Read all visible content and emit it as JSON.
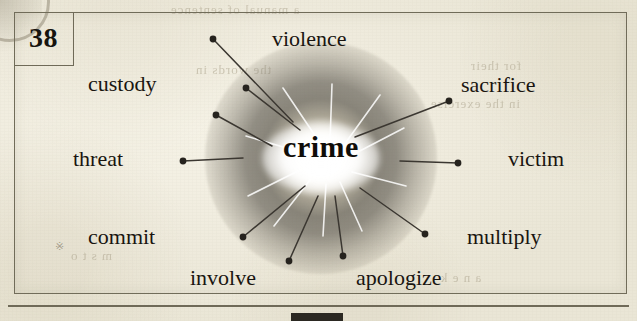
{
  "exercise": {
    "number": "38",
    "center_word": "crime"
  },
  "colors": {
    "paper": "#f2efe2",
    "ink": "#191510",
    "frame": "#6f6a58",
    "burst_dark": "#5b564d",
    "burst_light": "#ffffff"
  },
  "ghost_text": [
    {
      "text": "a manual of sentence",
      "x": 170,
      "y": 2
    },
    {
      "text": "the words in",
      "x": 195,
      "y": 62
    },
    {
      "text": "for their",
      "x": 470,
      "y": 58
    },
    {
      "text": "in the exercise",
      "x": 430,
      "y": 96
    },
    {
      "text": "a n e k",
      "x": 440,
      "y": 270
    },
    {
      "text": "m s t o",
      "x": 70,
      "y": 248
    }
  ],
  "nodes": [
    {
      "id": "violence",
      "label": "violence",
      "label_x": 272,
      "label_y": 28,
      "dot_x": 213,
      "dot_y": 39,
      "line_to_x": 293,
      "line_to_y": 122
    },
    {
      "id": "custody",
      "label": "custody",
      "label_x": 88,
      "label_y": 73,
      "dot_x": 246,
      "dot_y": 88,
      "line_to_x": 300,
      "line_to_y": 130
    },
    {
      "id": "sacrifice",
      "label": "sacrifice",
      "label_x": 461,
      "label_y": 74,
      "dot_x": 449,
      "dot_y": 101,
      "line_to_x": 355,
      "line_to_y": 137
    },
    {
      "id": "threat",
      "label": "threat",
      "label_x": 73,
      "label_y": 148,
      "dot_x": 183,
      "dot_y": 161,
      "line_to_x": 243,
      "line_to_y": 158
    },
    {
      "id": "victim",
      "label": "victim",
      "label_x": 508,
      "label_y": 148,
      "dot_x": 458,
      "dot_y": 163,
      "line_to_x": 400,
      "line_to_y": 161
    },
    {
      "id": "commit",
      "label": "commit",
      "label_x": 88,
      "label_y": 226,
      "dot_x": 243,
      "dot_y": 237,
      "line_to_x": 305,
      "line_to_y": 186
    },
    {
      "id": "multiply",
      "label": "multiply",
      "label_x": 467,
      "label_y": 226,
      "dot_x": 425,
      "dot_y": 234,
      "line_to_x": 360,
      "line_to_y": 188
    },
    {
      "id": "involve",
      "label": "involve",
      "label_x": 190,
      "label_y": 267,
      "dot_x": 289,
      "dot_y": 261,
      "line_to_x": 318,
      "line_to_y": 196
    },
    {
      "id": "apologize",
      "label": "apologize",
      "label_x": 356,
      "label_y": 267,
      "dot_x": 343,
      "dot_y": 256,
      "line_to_x": 335,
      "line_to_y": 196
    },
    {
      "id": "extra-upper-left",
      "label": "",
      "label_x": 0,
      "label_y": 0,
      "dot_x": 216,
      "dot_y": 115,
      "line_to_x": 272,
      "line_to_y": 146
    }
  ],
  "white_rays": [
    {
      "x1": 318,
      "y1": 140,
      "x2": 283,
      "y2": 88
    },
    {
      "x1": 330,
      "y1": 142,
      "x2": 332,
      "y2": 84
    },
    {
      "x1": 344,
      "y1": 145,
      "x2": 380,
      "y2": 95
    },
    {
      "x1": 352,
      "y1": 155,
      "x2": 404,
      "y2": 128
    },
    {
      "x1": 352,
      "y1": 172,
      "x2": 406,
      "y2": 186
    },
    {
      "x1": 340,
      "y1": 182,
      "x2": 362,
      "y2": 231
    },
    {
      "x1": 326,
      "y1": 184,
      "x2": 323,
      "y2": 236
    },
    {
      "x1": 310,
      "y1": 180,
      "x2": 274,
      "y2": 226
    },
    {
      "x1": 300,
      "y1": 170,
      "x2": 248,
      "y2": 196
    },
    {
      "x1": 300,
      "y1": 152,
      "x2": 246,
      "y2": 136
    }
  ]
}
